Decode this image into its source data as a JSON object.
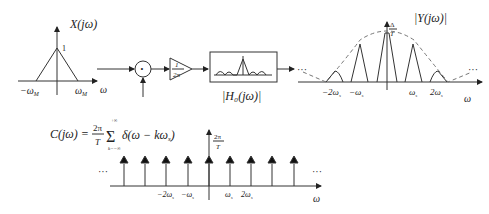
{
  "input_spectrum": {
    "title": "X(jω)",
    "peak_label": "1",
    "left_tick": "−ω",
    "left_tick_sub": "M",
    "right_tick": "ω",
    "right_tick_sub": "M",
    "axis_label": "ω"
  },
  "system": {
    "multiplier_symbol": "•",
    "amplifier_num": "1",
    "amplifier_den": "2π",
    "filter_label": "|H₀(jω)|"
  },
  "output_spectrum": {
    "title": "|Y(jω)|",
    "peak_num": "Δ",
    "peak_den": "T",
    "ellipsis_left": "···",
    "ellipsis_right": "···",
    "ticks": [
      "−2ω",
      "−ω",
      "ω",
      "2ω"
    ],
    "tick_sub": "s",
    "axis_label": "ω"
  },
  "comb": {
    "formula_lhs": "C(jω) =",
    "formula_frac_num": "2π",
    "formula_frac_den": "T",
    "formula_sum_upper": "+∞",
    "formula_sum_lower": "k=−∞",
    "formula_body": "δ(ω − kω",
    "formula_body_sub": "s",
    "formula_close": ")",
    "peak_num": "2π",
    "peak_den": "T",
    "ellipsis_left": "···",
    "ellipsis_right": "···",
    "ticks": [
      "−2ω",
      "−ω",
      "ω",
      "2ω"
    ],
    "tick_sub": "s",
    "axis_label": "ω"
  }
}
